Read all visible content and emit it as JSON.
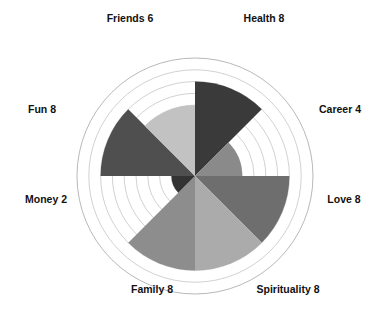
{
  "chart_data": {
    "type": "pie",
    "title": "",
    "subtitle": "",
    "xlabel": "",
    "ylabel": "",
    "scale_min": 0,
    "scale_max": 10,
    "rings": 10,
    "grid": true,
    "legend": "none",
    "label_format": "{name} {value}",
    "categories": [
      "Health",
      "Career",
      "Love",
      "Spirituality",
      "Family",
      "Money",
      "Fun",
      "Friends"
    ],
    "values": [
      8,
      4,
      8,
      8,
      8,
      2,
      8,
      6
    ],
    "start_angle_deg": -90,
    "sweep_deg": 45,
    "direction": "clockwise",
    "segments": [
      {
        "name": "Health",
        "value": 8,
        "label": "Health 8",
        "color": "#3a3a3a",
        "label_x": 264,
        "label_y": 22,
        "anchor": "middle"
      },
      {
        "name": "Career",
        "value": 4,
        "label": "Career 4",
        "color": "#8a8a8a",
        "label_x": 340,
        "label_y": 113,
        "anchor": "middle"
      },
      {
        "name": "Love",
        "value": 8,
        "label": "Love 8",
        "color": "#6e6e6e",
        "label_x": 344,
        "label_y": 203,
        "anchor": "middle"
      },
      {
        "name": "Spirituality",
        "value": 8,
        "label": "Spirituality 8",
        "color": "#ababab",
        "label_x": 288,
        "label_y": 293,
        "anchor": "middle"
      },
      {
        "name": "Family",
        "value": 8,
        "label": "Family 8",
        "color": "#8d8d8d",
        "label_x": 152,
        "label_y": 293,
        "anchor": "middle"
      },
      {
        "name": "Money",
        "value": 2,
        "label": "Money 2",
        "color": "#333333",
        "label_x": 46,
        "label_y": 203,
        "anchor": "middle"
      },
      {
        "name": "Fun",
        "value": 8,
        "label": "Fun 8",
        "color": "#4f4f4f",
        "label_x": 42,
        "label_y": 113,
        "anchor": "middle"
      },
      {
        "name": "Friends",
        "value": 6,
        "label": "Friends 6",
        "color": "#c2c2c2",
        "label_x": 130,
        "label_y": 22,
        "anchor": "middle"
      }
    ],
    "geometry": {
      "center_x": 195,
      "center_y": 176,
      "outer_radius": 118,
      "ring_step": 11.8
    },
    "colors": {
      "background": "#ffffff",
      "grid": "#bdbdbd",
      "text": "#111111"
    }
  }
}
